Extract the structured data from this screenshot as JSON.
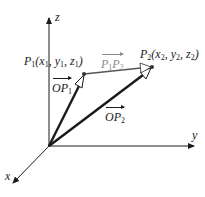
{
  "diagram": {
    "type": "3d-vector-diagram",
    "axes": {
      "x": {
        "label": "x"
      },
      "y": {
        "label": "y"
      },
      "z": {
        "label": "z"
      }
    },
    "points": {
      "p1": {
        "name": "P",
        "sub": "1",
        "coords_text": "(x",
        "c1": "1",
        "sep1": ", y",
        "c2": "1",
        "sep2": ", z",
        "c3": "1",
        "close": ")"
      },
      "p2": {
        "name": "P",
        "sub": "2",
        "coords_text": "(x",
        "c1": "2",
        "sep1": ", y",
        "c2": "2",
        "sep2": ", z",
        "c3": "2",
        "close": ")"
      }
    },
    "vectors": {
      "op1": {
        "main": "OP",
        "sub": "1"
      },
      "op2": {
        "main": "OP",
        "sub": "2"
      },
      "p1p2": {
        "a": "P",
        "a_sub": "1",
        "b": "P",
        "b_sub": "2"
      }
    },
    "colors": {
      "ink": "#1a1a1a",
      "gray_vector": "#555555",
      "gray_label": "#8a8a8a"
    }
  }
}
